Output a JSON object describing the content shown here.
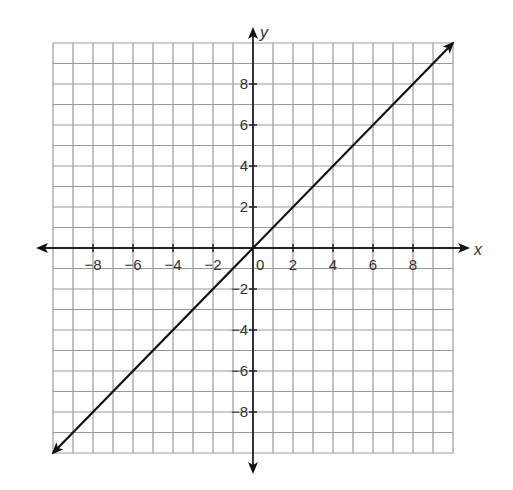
{
  "chart_data": {
    "type": "line",
    "title": "",
    "xlabel": "x",
    "ylabel": "y",
    "xlim": [
      -10,
      10
    ],
    "ylim": [
      -10,
      10
    ],
    "grid": true,
    "grid_step": 1,
    "x_ticks": [
      -8,
      -6,
      -4,
      -2,
      0,
      2,
      4,
      6,
      8
    ],
    "y_ticks": [
      -8,
      -6,
      -4,
      -2,
      2,
      4,
      6,
      8
    ],
    "x_tick_labels": [
      "−8",
      "−6",
      "−4",
      "−2",
      "0",
      "2",
      "4",
      "6",
      "8"
    ],
    "y_tick_labels": [
      "−8",
      "−6",
      "−4",
      "−2",
      "2",
      "4",
      "6",
      "8"
    ],
    "series": [
      {
        "name": "y = x",
        "equation": "y = x",
        "x": [
          -10,
          10
        ],
        "values": [
          -10,
          10
        ],
        "arrows_both_ends": true
      }
    ],
    "legend": null
  },
  "colors": {
    "grid": "#9a9a9a",
    "axis": "#222222",
    "line": "#111111",
    "text": "#333333"
  }
}
